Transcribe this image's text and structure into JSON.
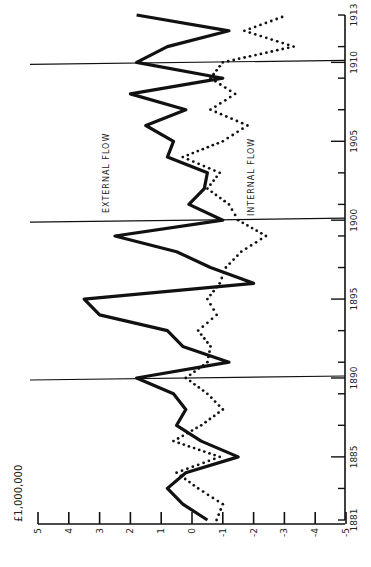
{
  "chart_data": {
    "type": "line",
    "orientation": "rotated-90-ccw",
    "title": "",
    "xlabel": "",
    "ylabel": "£1,000,000",
    "x_ticks": [
      1881,
      1885,
      1890,
      1895,
      1900,
      1905,
      1910,
      1913
    ],
    "x_range": [
      1881,
      1913
    ],
    "y_ticks": [
      5,
      4,
      3,
      2,
      1,
      0,
      -1,
      -2,
      -3,
      -4,
      -5
    ],
    "y_tick_labels": [
      "5",
      "4",
      "3",
      "2",
      "1",
      "0",
      "-1",
      "-2",
      "-3",
      "-4",
      "-5"
    ],
    "ylim": [
      -5,
      5
    ],
    "grid": false,
    "reference_lines_years": [
      1890,
      1900,
      1910
    ],
    "x": [
      1881,
      1882,
      1883,
      1884,
      1885,
      1886,
      1887,
      1888,
      1889,
      1890,
      1891,
      1892,
      1893,
      1894,
      1895,
      1896,
      1897,
      1898,
      1899,
      1900,
      1901,
      1902,
      1903,
      1904,
      1905,
      1906,
      1907,
      1908,
      1909,
      1910,
      1911,
      1912,
      1913
    ],
    "series": [
      {
        "name": "EXTERNAL FLOW",
        "style": "solid-thick",
        "values": [
          -0.5,
          0.3,
          0.8,
          0.2,
          -1.5,
          -0.3,
          0.5,
          0.2,
          0.6,
          1.8,
          -1.2,
          0.3,
          0.8,
          3.0,
          3.5,
          -2.0,
          -0.6,
          0.5,
          2.5,
          -1.0,
          0.1,
          -0.4,
          -0.5,
          0.8,
          0.6,
          1.5,
          0.2,
          2.0,
          -1.0,
          1.8,
          0.8,
          -1.2,
          1.8
        ]
      },
      {
        "name": "INTERNAL FLOW",
        "style": "dotted",
        "values": [
          -0.8,
          -1.0,
          -0.2,
          0.5,
          -0.9,
          0.6,
          -0.3,
          -1.0,
          -0.5,
          0.2,
          -0.5,
          -0.6,
          -0.2,
          -0.8,
          -0.5,
          -0.9,
          -1.1,
          -1.6,
          -2.4,
          -1.5,
          -1.2,
          -0.5,
          -0.9,
          0.3,
          -1.0,
          -1.8,
          -0.6,
          -1.4,
          -0.6,
          -1.0,
          -3.3,
          -1.7,
          -3.1
        ]
      }
    ],
    "annotations": [
      "EXTERNAL FLOW",
      "INTERNAL FLOW"
    ]
  },
  "labels": {
    "unit": "£1,000,000",
    "external": "EXTERNAL FLOW",
    "internal": "INTERNAL FLOW"
  },
  "colors": {
    "ink": "#111111",
    "background": "#ffffff"
  }
}
